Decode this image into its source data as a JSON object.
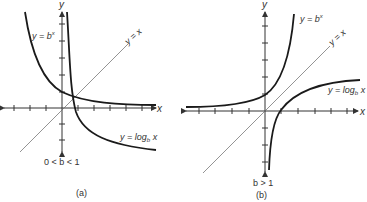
{
  "panels": [
    {
      "id": "a",
      "caption": "(a)",
      "condition": "0 < b < 1",
      "axis_x_label": "x",
      "axis_y_label": "y",
      "curves": {
        "exp_label_prefix": "y = b",
        "exp_label_sup": "x",
        "identity_label": "y = x",
        "log_label_prefix": "y = log",
        "log_label_sub": "b",
        "log_label_suffix": " x"
      }
    },
    {
      "id": "b",
      "caption": "(b)",
      "condition": "b > 1",
      "axis_x_label": "x",
      "axis_y_label": "y",
      "curves": {
        "exp_label_prefix": "y = b",
        "exp_label_sup": "x",
        "identity_label": "y = x",
        "log_label_prefix": "y = log",
        "log_label_sub": "b",
        "log_label_suffix": " x"
      }
    }
  ],
  "colors": {
    "curve": "#1a1a1a",
    "axis": "#333333",
    "identity_line": "#555555",
    "text": "#333333"
  }
}
